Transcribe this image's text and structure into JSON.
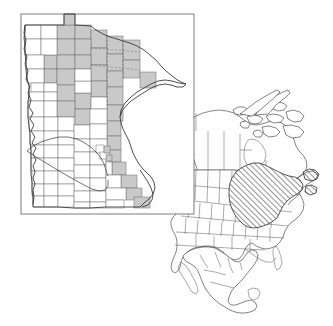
{
  "figure": {
    "type": "map",
    "title": "",
    "background_color": "#ffffff",
    "width": 333,
    "height": 326,
    "panels": [
      {
        "id": "minnesota-county-map",
        "name": "Minnesota county map with shaded counties",
        "frame": {
          "x": 21,
          "y": 14,
          "width": 173,
          "height": 200
        },
        "frame_color": "#5a5a5a"
      },
      {
        "id": "north-america-locator-map",
        "name": "North America locator map with hatched range",
        "frame": null
      }
    ]
  },
  "legend": {
    "shaded_fill_color": "#c9c9c9",
    "unshaded_fill_color": "#ffffff",
    "county_border_color": "#6b6b6b",
    "state_border_color": "#3c3c3c",
    "hatch_color": "#111111",
    "hatch_angle_degrees": 45
  },
  "minnesota": {
    "name": "Minnesota",
    "shaded_county_count": 34,
    "unshaded_county_count": 53,
    "features": [
      "northwest-angle",
      "arrowhead-region",
      "lake-superior-shoreline",
      "red-river-western-border",
      "mississippi-river-southeastern-border",
      "diagonal-ecoregion-boundary"
    ]
  },
  "north_america": {
    "countries": [
      "Canada",
      "United States",
      "Mexico",
      "Central America"
    ],
    "features": [
      "alaska",
      "canadian-arctic-archipelago",
      "hudson-bay",
      "great-lakes",
      "gulf-of-mexico",
      "baja-california",
      "newfoundland",
      "florida-peninsula",
      "yucatan-peninsula"
    ],
    "hatched_region_label": "eastern-deciduous-forest-range"
  },
  "chart_data": {
    "type": "map",
    "title": "",
    "series": [
      {
        "name": "Shaded Minnesota counties",
        "value": 34,
        "fill": "#c9c9c9"
      },
      {
        "name": "Unshaded Minnesota counties",
        "value": 53,
        "fill": "#ffffff"
      },
      {
        "name": "Hatched North American range",
        "value": 1,
        "fill": "diagonal-hatch"
      }
    ]
  }
}
